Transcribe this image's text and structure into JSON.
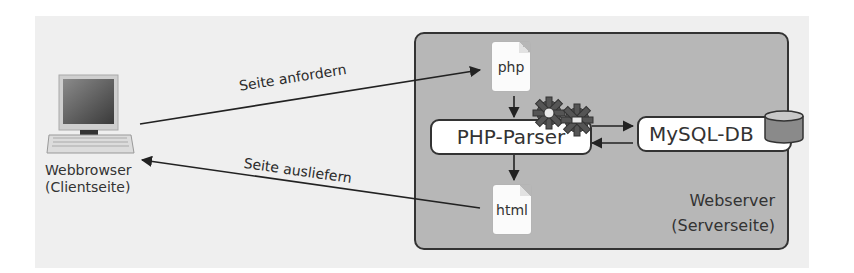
{
  "diagram": {
    "client": {
      "icon": "computer-icon",
      "label_line1": "Webbrowser",
      "label_line2": "(Clientseite)"
    },
    "arrows": {
      "request_label": "Seite anfordern",
      "response_label": "Seite ausliefern"
    },
    "server": {
      "label_line1": "Webserver",
      "label_line2": "(Serverseite)",
      "php_file": "php",
      "html_file": "html",
      "parser": "PHP-Parser",
      "parser_icon": "gears-icon",
      "database": "MySQL-DB",
      "database_icon": "database-cylinder-icon"
    },
    "colors": {
      "background": "#efefef",
      "server_fill": "#b7b7b7",
      "stroke": "#333333",
      "box_fill": "#ffffff",
      "gear": "#555555"
    }
  }
}
